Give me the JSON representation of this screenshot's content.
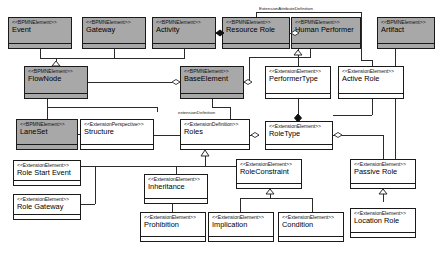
{
  "diagram": {
    "type": "uml-class-diagram",
    "stereotypes": {
      "bpmn": "<<BPMNElement>>",
      "ext_element": "<<ExtensionElement>>",
      "ext_definition": "<<ExtensionDefinition>>",
      "ext_perspective": "<<ExtensionPerspective>>"
    },
    "colors": {
      "shaded_fill": "#a8a8a8",
      "plain_fill": "#ffffff",
      "border": "#1a1a1a",
      "line": "#2b2b2b",
      "background": "#ffffff"
    },
    "classes": [
      {
        "id": "event",
        "stereotype": "<<BPMNElement>>",
        "name": "Event",
        "shaded": true,
        "x": 8,
        "y": 17,
        "w": 64,
        "h": 32
      },
      {
        "id": "gateway",
        "stereotype": "<<BPMNElement>>",
        "name": "Gateway",
        "shaded": true,
        "x": 82,
        "y": 17,
        "w": 64,
        "h": 32
      },
      {
        "id": "activity",
        "stereotype": "<<BPMNElement>>",
        "name": "Activity",
        "shaded": true,
        "x": 152,
        "y": 17,
        "w": 64,
        "h": 32
      },
      {
        "id": "resource-role",
        "stereotype": "<<BPMNElement>>",
        "name": "Resource Role",
        "shaded": true,
        "x": 222,
        "y": 17,
        "w": 68,
        "h": 32
      },
      {
        "id": "human-performer",
        "stereotype": "<<BPMNElement>>",
        "name": "Human Performer",
        "shaded": true,
        "x": 291,
        "y": 17,
        "w": 70,
        "h": 32
      },
      {
        "id": "artifact",
        "stereotype": "<<BPMNElement>>",
        "name": "Artifact",
        "shaded": true,
        "x": 377,
        "y": 17,
        "w": 58,
        "h": 32
      },
      {
        "id": "flownode",
        "stereotype": "<<BPMNElement>>",
        "name": "FlowNode",
        "shaded": true,
        "x": 24,
        "y": 66,
        "w": 64,
        "h": 33
      },
      {
        "id": "baseelement",
        "stereotype": "<<BPMNElement>>",
        "name": "BaseElement",
        "shaded": true,
        "x": 180,
        "y": 66,
        "w": 64,
        "h": 33
      },
      {
        "id": "performertype",
        "stereotype": "<<ExtensionElement>>",
        "name": "PerformerType",
        "shaded": false,
        "x": 265,
        "y": 66,
        "w": 66,
        "h": 33
      },
      {
        "id": "active-role",
        "stereotype": "<<ExtensionElement>>",
        "name": "Active Role",
        "shaded": false,
        "x": 338,
        "y": 66,
        "w": 66,
        "h": 33
      },
      {
        "id": "laneset",
        "stereotype": "<<BPMNElement>>",
        "name": "LaneSet",
        "shaded": true,
        "x": 16,
        "y": 119,
        "w": 62,
        "h": 31
      },
      {
        "id": "structure",
        "stereotype": "<<ExtensionPerspective>>",
        "name": "Structure",
        "shaded": false,
        "x": 80,
        "y": 119,
        "w": 74,
        "h": 31
      },
      {
        "id": "roles",
        "stereotype": "<<ExtensionDefinition>>",
        "name": "Roles",
        "shaded": false,
        "x": 180,
        "y": 119,
        "w": 70,
        "h": 31
      },
      {
        "id": "roletype",
        "stereotype": "<<ExtensionElement>>",
        "name": "RoleType",
        "shaded": false,
        "x": 265,
        "y": 121,
        "w": 68,
        "h": 29
      },
      {
        "id": "role-start-event",
        "stereotype": "<<ExtensionElement>>",
        "name": "Role Start Event",
        "shaded": false,
        "x": 13,
        "y": 160,
        "w": 68,
        "h": 26
      },
      {
        "id": "role-gateway",
        "stereotype": "<<ExtensionElement>>",
        "name": "Role Gateway",
        "shaded": false,
        "x": 13,
        "y": 194,
        "w": 68,
        "h": 26
      },
      {
        "id": "inheritance",
        "stereotype": "<<ExtensionElement>>",
        "name": "Inheritance",
        "shaded": false,
        "x": 144,
        "y": 174,
        "w": 64,
        "h": 30
      },
      {
        "id": "roleconstraint",
        "stereotype": "<<ExtensionElement>>",
        "name": "RoleConstraint",
        "shaded": false,
        "x": 236,
        "y": 159,
        "w": 66,
        "h": 30
      },
      {
        "id": "passive-role",
        "stereotype": "<<ExtensionElement>>",
        "name": "Passive Role",
        "shaded": false,
        "x": 350,
        "y": 159,
        "w": 66,
        "h": 30
      },
      {
        "id": "prohibition",
        "stereotype": "<<ExtensionElement>>",
        "name": "Prohibition",
        "shaded": false,
        "x": 140,
        "y": 212,
        "w": 66,
        "h": 30
      },
      {
        "id": "implication",
        "stereotype": "<<ExtensionElement>>",
        "name": "Implication",
        "shaded": false,
        "x": 208,
        "y": 212,
        "w": 66,
        "h": 30
      },
      {
        "id": "condition",
        "stereotype": "<<ExtensionElement>>",
        "name": "Condition",
        "shaded": false,
        "x": 278,
        "y": 212,
        "w": 66,
        "h": 30
      },
      {
        "id": "location-role",
        "stereotype": "<<ExtensionElement>>",
        "name": "Location Role",
        "shaded": false,
        "x": 350,
        "y": 208,
        "w": 66,
        "h": 30
      }
    ],
    "edge_labels": [
      {
        "id": "ext-attr-def",
        "text": "ExtensionAttributeDefinition",
        "x": 258,
        "y": 9
      },
      {
        "id": "ext-def",
        "text": "extensionDefinition",
        "x": 177,
        "y": 112
      }
    ]
  }
}
